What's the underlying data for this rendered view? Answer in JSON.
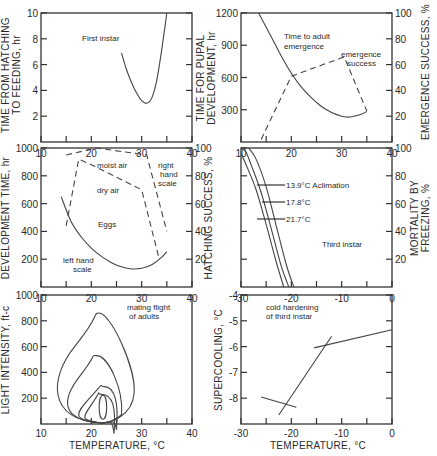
{
  "figure": {
    "shared_xlabel_left": "TEMPERATURE, °C",
    "shared_xlabel_right": "TEMPERATURE, °C"
  },
  "chart_data": [
    {
      "id": "first-instar",
      "type": "line",
      "title": "First instar",
      "xlabel": "Temperature, °C",
      "ylabel": "TIME FROM HATCHING TO FEEDING, hr",
      "xlim": [
        10,
        40
      ],
      "ylim": [
        0,
        10
      ],
      "xticks": [
        10,
        20,
        30,
        40
      ],
      "yticks": [
        2,
        4,
        6,
        8,
        10
      ],
      "series": [
        {
          "name": "Time from hatching to feeding",
          "style": "solid",
          "x": [
            26,
            27,
            28,
            29,
            30,
            31,
            32,
            33,
            34,
            35
          ],
          "y": [
            6.9,
            5.6,
            4.6,
            3.8,
            3.2,
            3.0,
            3.4,
            4.8,
            7.2,
            10.0
          ]
        }
      ]
    },
    {
      "id": "pupal-development",
      "type": "line",
      "title": "Time to adult emergence",
      "xlabel": "Temperature, °C",
      "ylabel": "TIME FOR PUPAL DEVELOPMENT, hr",
      "ylabel_right": "EMERGENCE SUCCESS, %",
      "xlim": [
        10,
        40
      ],
      "ylim": [
        0,
        1200
      ],
      "ylim_right": [
        0,
        100
      ],
      "xticks": [
        10,
        20,
        30,
        40
      ],
      "yticks": [
        300,
        600,
        900,
        1200
      ],
      "yticks_right": [
        20,
        40,
        60,
        80,
        100
      ],
      "annotations": [
        "Time to adult emergence",
        "emergence success"
      ],
      "series": [
        {
          "name": "Time to adult emergence (hr)",
          "style": "solid",
          "axis": "left",
          "x": [
            13.5,
            16,
            18,
            20,
            22,
            24,
            26,
            28,
            30,
            31,
            32,
            34,
            35
          ],
          "y": [
            1200,
            980,
            800,
            640,
            510,
            410,
            330,
            275,
            240,
            232,
            235,
            260,
            285
          ]
        },
        {
          "name": "Emergence success (%)",
          "style": "dashed",
          "axis": "right",
          "x": [
            14,
            20,
            30.5,
            35
          ],
          "y": [
            2,
            51,
            66,
            24
          ]
        }
      ]
    },
    {
      "id": "eggs",
      "type": "line",
      "title": "Eggs",
      "xlabel": "Temperature, °C",
      "ylabel": "DEVELOPMENT TIME, hr",
      "ylabel_right": "HATCHING SUCCESS, %",
      "xlim": [
        10,
        40
      ],
      "ylim": [
        0,
        1000
      ],
      "ylim_right": [
        0,
        100
      ],
      "xticks": [
        10,
        20,
        30,
        40
      ],
      "yticks": [
        200,
        400,
        600,
        800,
        1000
      ],
      "yticks_right": [
        20,
        40,
        60,
        80,
        100
      ],
      "annotations": [
        "moist air",
        "dry air",
        "right hand scale",
        "left hand scale",
        "Eggs"
      ],
      "series": [
        {
          "name": "Development time (left hand scale)",
          "style": "solid",
          "axis": "left",
          "x": [
            14,
            16,
            18,
            20,
            22,
            24,
            26,
            28,
            30,
            32,
            34,
            35
          ],
          "y": [
            650,
            470,
            360,
            280,
            220,
            175,
            145,
            130,
            135,
            160,
            215,
            255
          ]
        },
        {
          "name": "Hatching success, moist air (%)",
          "style": "dashed",
          "axis": "right",
          "x": [
            15,
            21,
            31,
            35
          ],
          "y": [
            95,
            100,
            95,
            40
          ]
        },
        {
          "name": "Hatching success, dry air (%)",
          "style": "dashed",
          "axis": "right",
          "x": [
            15,
            17.5,
            20,
            30,
            33.5
          ],
          "y": [
            44,
            92,
            88,
            70,
            20
          ]
        }
      ]
    },
    {
      "id": "third-instar-mortality",
      "type": "line",
      "title": "Third instar",
      "xlabel": "Temperature, °C",
      "ylabel_right": "MORTALITY BY FREEZING, %",
      "xlim": [
        -30,
        0
      ],
      "ylim": [
        0,
        100
      ],
      "xticks": [
        -30,
        -20,
        -10,
        0
      ],
      "xticks_top": [
        10,
        20,
        30,
        40
      ],
      "yticks": [
        20,
        40,
        60,
        80,
        100
      ],
      "annotations": [
        "13.9°C Aclimation",
        "17.8°C",
        "21.7°C"
      ],
      "series": [
        {
          "name": "21.7°C",
          "style": "solid",
          "x": [
            -30,
            -29,
            -27,
            -25,
            -23,
            -21.5
          ],
          "y": [
            96,
            88,
            70,
            45,
            18,
            0
          ]
        },
        {
          "name": "17.8°C",
          "style": "solid",
          "x": [
            -30,
            -29,
            -28,
            -26,
            -24,
            -22,
            -20.5
          ],
          "y": [
            100,
            97,
            88,
            68,
            42,
            15,
            0
          ]
        },
        {
          "name": "13.9°C",
          "style": "solid",
          "x": [
            -28.5,
            -27,
            -25,
            -23,
            -21,
            -19.5
          ],
          "y": [
            100,
            92,
            72,
            44,
            16,
            0
          ]
        }
      ]
    },
    {
      "id": "mating-flight",
      "type": "line",
      "title": "mating flight of adults",
      "xlabel": "TEMPERATURE, °C",
      "ylabel": "LIGHT INTENSITY, ft-c",
      "xlim": [
        10,
        40
      ],
      "ylim": [
        0,
        1000
      ],
      "xticks": [
        10,
        20,
        30,
        40
      ],
      "yticks": [
        200,
        400,
        600,
        800,
        1000
      ],
      "series": [
        {
          "name": "contour outer",
          "peak": [
            21.5,
            860
          ],
          "xrange": [
            12,
            28.5
          ]
        },
        {
          "name": "contour 2",
          "peak": [
            21,
            530
          ],
          "xrange": [
            14.5,
            26
          ]
        },
        {
          "name": "contour 3",
          "peak": [
            22.5,
            290
          ],
          "xrange": [
            17,
            25
          ]
        },
        {
          "name": "contour 4",
          "peak": [
            22,
            230
          ],
          "xrange": [
            18.5,
            24.5
          ]
        },
        {
          "name": "contour inner",
          "center": [
            22.3,
            130
          ],
          "xrange": [
            21.5,
            23
          ]
        }
      ]
    },
    {
      "id": "cold-hardening",
      "type": "line",
      "title": "cold hardening of third instar",
      "xlabel": "TEMPERATURE, °C",
      "ylabel": "SUPERCOOLING, °C",
      "xlim": [
        -30,
        0
      ],
      "ylim": [
        -9,
        -4
      ],
      "xticks": [
        -30,
        -20,
        -10,
        0
      ],
      "yticks": [
        -4,
        -5,
        -6,
        -7,
        -8
      ],
      "series": [
        {
          "name": "low segment",
          "x": [
            -26,
            -19
          ],
          "y": [
            -7.95,
            -8.35
          ]
        },
        {
          "name": "steep segment",
          "x": [
            -22.5,
            -12
          ],
          "y": [
            -8.65,
            -5.6
          ]
        },
        {
          "name": "upper segment",
          "x": [
            -15.5,
            0
          ],
          "y": [
            -6.05,
            -5.35
          ]
        }
      ]
    }
  ]
}
